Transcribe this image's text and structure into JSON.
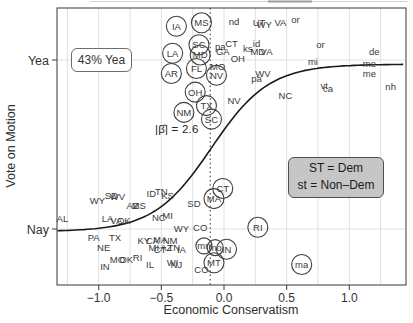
{
  "chart_data": {
    "type": "scatter",
    "title": "",
    "xlabel": "Economic Conservatism",
    "ylabel": "Vote on Motion",
    "x_ticks": [
      {
        "value": -1.0,
        "label": "−1.0"
      },
      {
        "value": -0.5,
        "label": "−0.5"
      },
      {
        "value": 0.0,
        "label": "0.0"
      },
      {
        "value": 0.5,
        "label": "0.5"
      },
      {
        "value": 1.0,
        "label": "1.0"
      }
    ],
    "y_ticks": [
      {
        "value": 1,
        "label": "Yea"
      },
      {
        "value": 0,
        "label": "Nay"
      }
    ],
    "xlim": [
      -1.33,
      1.45
    ],
    "ylim": [
      -0.33,
      1.31
    ],
    "grid": {
      "x_step": 0.25,
      "x_min": -1.25,
      "x_max": 1.25,
      "y_lines": [
        0,
        1
      ],
      "color": "#e0e0e0"
    },
    "threshold_line_x": -0.11,
    "curve": {
      "type": "logistic",
      "bottom": -0.015,
      "top": 0.975,
      "midpoint": -0.1,
      "scale": 0.23
    },
    "annotations": {
      "yea_pct": "43% Yea",
      "beta": "|β̂| = 2.6",
      "legend_line1": "ST = Dem",
      "legend_line2": "st = Non–Dem"
    },
    "points": [
      {
        "label": "IA",
        "x": -0.38,
        "y": 1.2,
        "circled": true
      },
      {
        "label": "MS",
        "x": -0.18,
        "y": 1.22,
        "circled": true
      },
      {
        "label": "SC",
        "x": -0.2,
        "y": 1.09,
        "circled": true
      },
      {
        "label": "LA",
        "x": -0.41,
        "y": 1.04,
        "circled": true
      },
      {
        "label": "MD",
        "x": -0.19,
        "y": 1.03,
        "circled": true
      },
      {
        "label": "AR",
        "x": -0.42,
        "y": 0.92,
        "circled": true
      },
      {
        "label": "FL",
        "x": -0.22,
        "y": 0.95,
        "circled": true
      },
      {
        "label": "NV",
        "x": -0.06,
        "y": 0.91,
        "circled": true
      },
      {
        "label": "OH",
        "x": -0.23,
        "y": 0.81,
        "circled": true
      },
      {
        "label": "NM",
        "x": -0.32,
        "y": 0.69,
        "circled": true
      },
      {
        "label": "TX",
        "x": -0.14,
        "y": 0.73,
        "circled": true
      },
      {
        "label": "SC",
        "x": -0.1,
        "y": 0.65,
        "circled": true
      },
      {
        "label": "nd",
        "x": 0.08,
        "y": 1.23,
        "circled": false
      },
      {
        "label": "UT",
        "x": 0.28,
        "y": 1.22,
        "circled": false
      },
      {
        "label": "WY",
        "x": 0.32,
        "y": 1.21,
        "circled": false
      },
      {
        "label": "VA",
        "x": 0.45,
        "y": 1.22,
        "circled": false
      },
      {
        "label": "or",
        "x": 0.57,
        "y": 1.24,
        "circled": false
      },
      {
        "label": "CT",
        "x": 0.06,
        "y": 1.1,
        "circled": false
      },
      {
        "label": "pa",
        "x": -0.03,
        "y": 1.08,
        "circled": false
      },
      {
        "label": "GA",
        "x": -0.01,
        "y": 1.05,
        "circled": false
      },
      {
        "label": "id",
        "x": 0.26,
        "y": 1.1,
        "circled": false
      },
      {
        "label": "ks",
        "x": 0.19,
        "y": 1.07,
        "circled": false
      },
      {
        "label": "MD",
        "x": 0.27,
        "y": 1.05,
        "circled": false
      },
      {
        "label": "VA",
        "x": 0.34,
        "y": 1.05,
        "circled": false
      },
      {
        "label": "OH",
        "x": 0.11,
        "y": 1.01,
        "circled": false
      },
      {
        "label": "MO",
        "x": -0.05,
        "y": 0.96,
        "circled": false
      },
      {
        "label": "or",
        "x": 0.77,
        "y": 1.09,
        "circled": false
      },
      {
        "label": "de",
        "x": 1.2,
        "y": 1.05,
        "circled": false
      },
      {
        "label": "mi",
        "x": 0.71,
        "y": 0.99,
        "circled": false
      },
      {
        "label": "me",
        "x": 1.16,
        "y": 0.98,
        "circled": false
      },
      {
        "label": "me",
        "x": 1.16,
        "y": 0.92,
        "circled": false
      },
      {
        "label": "nh",
        "x": 1.33,
        "y": 0.84,
        "circled": false
      },
      {
        "label": "vt",
        "x": 0.8,
        "y": 0.85,
        "circled": false
      },
      {
        "label": "ca",
        "x": 0.83,
        "y": 0.83,
        "circled": false
      },
      {
        "label": "NC",
        "x": 0.49,
        "y": 0.79,
        "circled": false
      },
      {
        "label": "WV",
        "x": 0.31,
        "y": 0.92,
        "circled": false
      },
      {
        "label": "pa",
        "x": 0.26,
        "y": 0.89,
        "circled": false
      },
      {
        "label": "NV",
        "x": 0.08,
        "y": 0.76,
        "circled": false
      },
      {
        "label": "AL",
        "x": -1.29,
        "y": 0.06,
        "circled": false
      },
      {
        "label": "WY",
        "x": -1.01,
        "y": 0.17,
        "circled": false
      },
      {
        "label": "SD",
        "x": -0.9,
        "y": 0.2,
        "circled": false
      },
      {
        "label": "WV",
        "x": -0.85,
        "y": 0.19,
        "circled": false
      },
      {
        "label": "AZ",
        "x": -0.73,
        "y": 0.14,
        "circled": false
      },
      {
        "label": "MS",
        "x": -0.68,
        "y": 0.14,
        "circled": false
      },
      {
        "label": "ID",
        "x": -0.58,
        "y": 0.21,
        "circled": false
      },
      {
        "label": "TN",
        "x": -0.5,
        "y": 0.22,
        "circled": false
      },
      {
        "label": "KS",
        "x": -0.45,
        "y": 0.2,
        "circled": false
      },
      {
        "label": "LA",
        "x": -0.93,
        "y": 0.06,
        "circled": false
      },
      {
        "label": "VA",
        "x": -0.86,
        "y": 0.05,
        "circled": false
      },
      {
        "label": "OK",
        "x": -0.8,
        "y": 0.05,
        "circled": false
      },
      {
        "label": "NC",
        "x": -0.52,
        "y": 0.07,
        "circled": false
      },
      {
        "label": "MI",
        "x": -0.45,
        "y": 0.08,
        "circled": false
      },
      {
        "label": "SD",
        "x": -0.24,
        "y": 0.15,
        "circled": false
      },
      {
        "label": "CO",
        "x": -0.19,
        "y": 0.01,
        "circled": false
      },
      {
        "label": "PA",
        "x": -1.04,
        "y": -0.05,
        "circled": false
      },
      {
        "label": "TX",
        "x": -0.87,
        "y": -0.05,
        "circled": false
      },
      {
        "label": "KY",
        "x": -0.64,
        "y": -0.07,
        "circled": false
      },
      {
        "label": "CA",
        "x": -0.57,
        "y": -0.07,
        "circled": false
      },
      {
        "label": "MA",
        "x": -0.51,
        "y": -0.06,
        "circled": false
      },
      {
        "label": "NM",
        "x": -0.43,
        "y": -0.07,
        "circled": false
      },
      {
        "label": "WY",
        "x": -0.34,
        "y": 0.0,
        "circled": false
      },
      {
        "label": "NE",
        "x": -0.96,
        "y": -0.11,
        "circled": false
      },
      {
        "label": "IN",
        "x": -0.95,
        "y": -0.22,
        "circled": false
      },
      {
        "label": "MO",
        "x": -0.85,
        "y": -0.18,
        "circled": false
      },
      {
        "label": "OK",
        "x": -0.78,
        "y": -0.18,
        "circled": false
      },
      {
        "label": "RI",
        "x": -0.69,
        "y": -0.17,
        "circled": false
      },
      {
        "label": "IL",
        "x": -0.59,
        "y": -0.21,
        "circled": false
      },
      {
        "label": "MI",
        "x": -0.56,
        "y": -0.11,
        "circled": false
      },
      {
        "label": "CT",
        "x": -0.51,
        "y": -0.12,
        "circled": false
      },
      {
        "label": "AZ",
        "x": -0.46,
        "y": -0.11,
        "circled": false
      },
      {
        "label": "TN",
        "x": -0.4,
        "y": -0.11,
        "circled": false
      },
      {
        "label": "IA",
        "x": -0.34,
        "y": -0.12,
        "circled": false
      },
      {
        "label": "WI",
        "x": -0.41,
        "y": -0.2,
        "circled": false
      },
      {
        "label": "NJ",
        "x": -0.38,
        "y": -0.21,
        "circled": false
      },
      {
        "label": "CO",
        "x": -0.18,
        "y": -0.24,
        "circled": false
      },
      {
        "label": "CT",
        "x": -0.01,
        "y": 0.24,
        "circled": true
      },
      {
        "label": "MA",
        "x": -0.08,
        "y": 0.18,
        "circled": true
      },
      {
        "label": "RI",
        "x": 0.27,
        "y": 0.01,
        "circled": true
      },
      {
        "label": "mn",
        "x": -0.16,
        "y": -0.1,
        "circled": true,
        "r": 8
      },
      {
        "label": "mo",
        "x": -0.07,
        "y": -0.11,
        "circled": true,
        "r": 8
      },
      {
        "label": "IN",
        "x": 0.02,
        "y": -0.12,
        "circled": true
      },
      {
        "label": "MT",
        "x": -0.08,
        "y": -0.2,
        "circled": true
      },
      {
        "label": "ma",
        "x": 0.62,
        "y": -0.21,
        "circled": true
      }
    ]
  },
  "colors": {
    "text": "#333333",
    "point_text": "#3a3a3a",
    "curve": "#1a1a1a",
    "grid": "#e0e0e0",
    "axis_box": "#4a4a4a",
    "legend_fill": "#c6c6c6",
    "legend_border": "#4f4f4f"
  }
}
